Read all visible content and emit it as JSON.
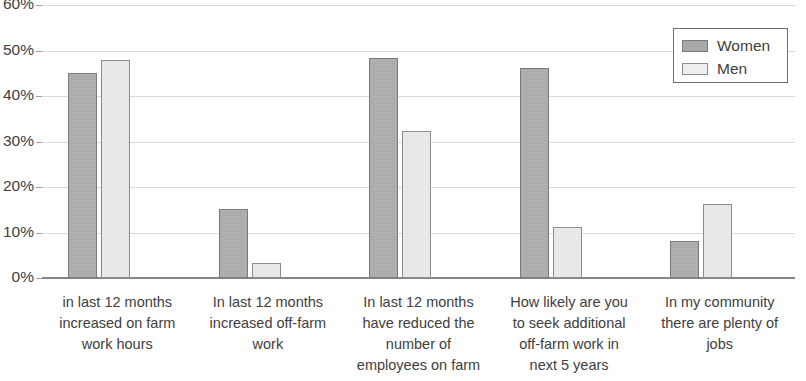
{
  "chart_data": {
    "type": "bar",
    "title": "",
    "xlabel": "",
    "ylabel": "",
    "ylim": [
      0,
      60
    ],
    "y_tick_labels": [
      "0%",
      "10%",
      "20%",
      "30%",
      "40%",
      "50%",
      "60%"
    ],
    "y_ticks": [
      0,
      10,
      20,
      30,
      40,
      50,
      60
    ],
    "grid": true,
    "legend_position": "top-right",
    "categories": [
      "in last 12 months increased on farm work hours",
      "In last 12 months increased off-farm work",
      "In last 12 months have reduced the number of employees on farm",
      "How likely are you to seek additional off-farm work in next 5 years",
      "In my community there are plenty of jobs"
    ],
    "category_lines": [
      [
        "in last 12 months",
        "increased on farm",
        "work hours"
      ],
      [
        "In last 12 months",
        "increased off-farm",
        "work"
      ],
      [
        "In last 12 months",
        "have reduced the",
        "number of",
        "employees on farm"
      ],
      [
        "How likely are you",
        "to seek additional",
        "off-farm work in",
        "next 5 years"
      ],
      [
        "In my community",
        "there are plenty of",
        "jobs"
      ]
    ],
    "series": [
      {
        "name": "Women",
        "color": "#a8a8a8",
        "values": [
          45.0,
          15.2,
          48.3,
          46.2,
          8.2
        ]
      },
      {
        "name": "Men",
        "color": "#e9e9e9",
        "values": [
          48.0,
          3.3,
          32.3,
          11.3,
          16.3
        ]
      }
    ]
  },
  "legend": {
    "items": [
      {
        "label": "Women"
      },
      {
        "label": "Men"
      }
    ]
  }
}
